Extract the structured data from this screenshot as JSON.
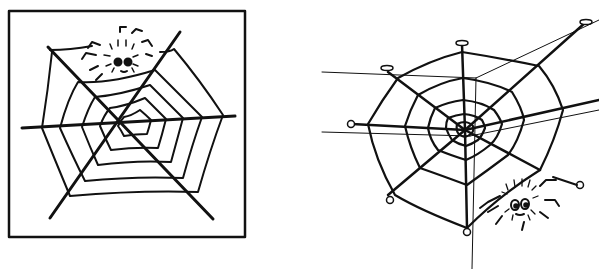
{
  "illustrations": [
    {
      "id": "left",
      "description": "Spider web inside a square frame with a spider at the top",
      "frame": true
    },
    {
      "id": "right",
      "description": "Perspective spider web anchored with pins, spider at bottom right",
      "frame": false
    }
  ],
  "colors": {
    "ink": "#111111",
    "background": "#ffffff"
  }
}
